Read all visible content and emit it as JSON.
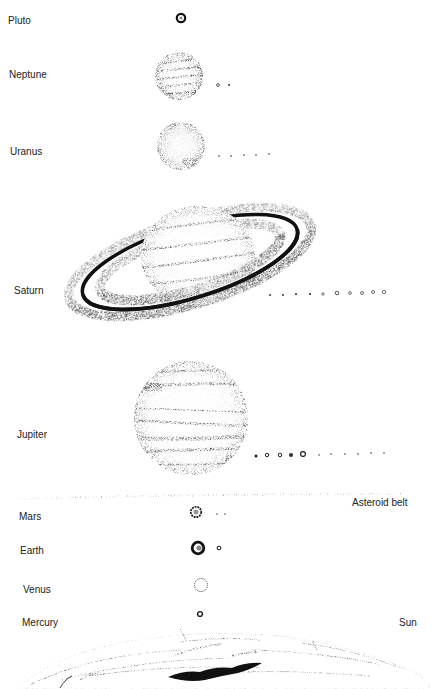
{
  "diagram": {
    "type": "solar-system-illustration",
    "colors": {
      "ink": "#1a1a1a",
      "stipple": "#555555",
      "background": "#ffffff"
    },
    "bodies": [
      {
        "name": "Pluto",
        "label_x": 8,
        "label_y": 15,
        "cx": 181,
        "cy": 18,
        "r": 5,
        "moons": []
      },
      {
        "name": "Neptune",
        "label_x": 9,
        "label_y": 69,
        "cx": 179,
        "cy": 76,
        "r": 24,
        "moons": [
          {
            "x": 218,
            "y": 85,
            "r": 1.6
          },
          {
            "x": 229,
            "y": 85,
            "r": 1
          }
        ]
      },
      {
        "name": "Uranus",
        "label_x": 10,
        "label_y": 146,
        "cx": 181,
        "cy": 146,
        "r": 24,
        "moons": [
          {
            "x": 219,
            "y": 156,
            "r": 0.9
          },
          {
            "x": 231,
            "y": 156,
            "r": 0.9
          },
          {
            "x": 244,
            "y": 155,
            "r": 0.9
          },
          {
            "x": 256,
            "y": 155,
            "r": 0.9
          },
          {
            "x": 269,
            "y": 154,
            "r": 0.9
          }
        ]
      },
      {
        "name": "Saturn",
        "label_x": 14,
        "label_y": 285,
        "cx": 198,
        "cy": 256,
        "r": 52,
        "moons": [
          {
            "x": 270,
            "y": 295,
            "r": 0.9
          },
          {
            "x": 283,
            "y": 295,
            "r": 0.9
          },
          {
            "x": 296,
            "y": 294,
            "r": 1
          },
          {
            "x": 310,
            "y": 294,
            "r": 1
          },
          {
            "x": 323,
            "y": 294,
            "r": 1.3
          },
          {
            "x": 337,
            "y": 293,
            "r": 2
          },
          {
            "x": 350,
            "y": 293,
            "r": 1.5
          },
          {
            "x": 363,
            "y": 293,
            "r": 1.6
          },
          {
            "x": 373,
            "y": 292,
            "r": 1.6
          },
          {
            "x": 384,
            "y": 292,
            "r": 1.8
          }
        ]
      },
      {
        "name": "Jupiter",
        "label_x": 17,
        "label_y": 429,
        "cx": 191,
        "cy": 418,
        "r": 57,
        "moons": [
          {
            "x": 256,
            "y": 456,
            "r": 1.6
          },
          {
            "x": 267,
            "y": 455,
            "r": 1.8
          },
          {
            "x": 280,
            "y": 455,
            "r": 1.9
          },
          {
            "x": 291,
            "y": 455,
            "r": 2.2
          },
          {
            "x": 303,
            "y": 454,
            "r": 2.6
          },
          {
            "x": 319,
            "y": 455,
            "r": 0.8
          },
          {
            "x": 331,
            "y": 454,
            "r": 0.8
          },
          {
            "x": 345,
            "y": 454,
            "r": 0.8
          },
          {
            "x": 358,
            "y": 454,
            "r": 0.8
          },
          {
            "x": 371,
            "y": 453,
            "r": 0.8
          },
          {
            "x": 384,
            "y": 453,
            "r": 0.8
          }
        ]
      },
      {
        "name": "Mars",
        "label_x": 19,
        "label_y": 512,
        "cx": 196,
        "cy": 512,
        "r": 6,
        "moons": [
          {
            "x": 217,
            "y": 514,
            "r": 0.8
          },
          {
            "x": 225,
            "y": 514,
            "r": 0.8
          }
        ]
      },
      {
        "name": "Earth",
        "label_x": 20,
        "label_y": 545,
        "cx": 198,
        "cy": 548,
        "r": 7,
        "moons": [
          {
            "x": 219,
            "y": 548,
            "r": 2
          }
        ]
      },
      {
        "name": "Venus",
        "label_x": 23,
        "label_y": 584,
        "cx": 201,
        "cy": 585,
        "r": 7,
        "moons": []
      },
      {
        "name": "Mercury",
        "label_x": 22,
        "label_y": 617,
        "cx": 200,
        "cy": 614,
        "r": 3,
        "moons": []
      }
    ],
    "labels": {
      "pluto": "Pluto",
      "neptune": "Neptune",
      "uranus": "Uranus",
      "saturn": "Saturn",
      "jupiter": "Jupiter",
      "asteroid_belt": "Asteroid belt",
      "mars": "Mars",
      "earth": "Earth",
      "venus": "Venus",
      "mercury": "Mercury",
      "sun": "Sun"
    },
    "asteroid_belt": {
      "y": 497,
      "x_start": 18,
      "x_end": 405
    }
  }
}
